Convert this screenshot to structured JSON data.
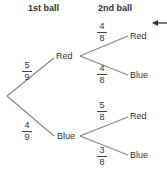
{
  "headers": {
    "first": "1st ball",
    "second": "2nd ball"
  },
  "tree": {
    "first": {
      "red": {
        "label": "Red",
        "num": "5",
        "den": "9"
      },
      "blue": {
        "label": "Blue",
        "num": "4",
        "den": "9"
      }
    },
    "second_after_red": {
      "red": {
        "label": "Red",
        "num": "4",
        "den": "8"
      },
      "blue": {
        "label": "Blue",
        "num": "4",
        "den": "8"
      }
    },
    "second_after_blue": {
      "red": {
        "label": "Red",
        "num": "5",
        "den": "8"
      },
      "blue": {
        "label": "Blue",
        "num": "3",
        "den": "8"
      }
    }
  },
  "colors": {
    "line": "#888888",
    "text": "#333333"
  },
  "pointer": "left-arrow-icon"
}
